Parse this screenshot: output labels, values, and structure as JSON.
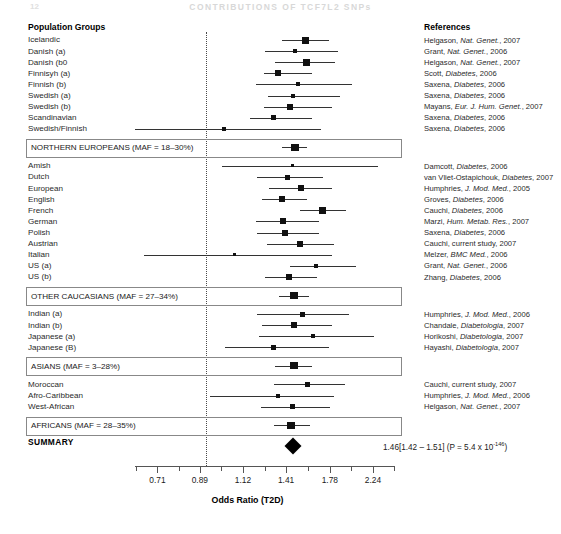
{
  "running_head": "CONTRIBUTIONS OF TCF7L2 SNPs",
  "page_number": "12",
  "headers": {
    "population_groups": "Population Groups",
    "references": "References"
  },
  "axis": {
    "title": "Odds Ratio (T2D)",
    "tick_labels": [
      "0.71",
      "0.89",
      "1.12",
      "1.41",
      "1.78",
      "2.24"
    ],
    "tick_values": [
      0.71,
      0.89,
      1.12,
      1.41,
      1.78,
      2.24
    ],
    "null_value": "1.0",
    "scale": "log",
    "xmin": 0.63,
    "xmax": 2.52
  },
  "summary": {
    "label": "SUMMARY",
    "or": 1.46,
    "ci_low": 1.42,
    "ci_high": 1.51,
    "text": "1.46[1.42 – 1.51] (P = 5.4 x 10",
    "exponent": "-146",
    "text_tail": ")"
  },
  "chart_data": {
    "type": "forest",
    "xlabel": "Odds Ratio (T2D)",
    "ylabel": "Population Groups",
    "xscale": "log",
    "xlim": [
      0.63,
      2.52
    ],
    "null_line": 1.0,
    "groups": [
      {
        "name": "NORTHERN EUROPEANS",
        "maf": "18–30%",
        "summary_label": "NORTHERN EUROPEANS (MAF = 18–30%)",
        "summary_or": 1.48,
        "summary_ci": [
          1.38,
          1.58
        ],
        "studies": [
          {
            "label": "Icelandic",
            "or": 1.56,
            "ci": [
              1.38,
              1.77
            ],
            "weight": 5,
            "reference": "Helgason, ",
            "ref_italic": "Nat. Genet.",
            "ref_tail": ", 2007"
          },
          {
            "label": "Danish (a)",
            "or": 1.48,
            "ci": [
              1.26,
              1.86
            ],
            "weight": 2,
            "reference": "Grant, ",
            "ref_italic": "Nat. Genet.",
            "ref_tail": ", 2006"
          },
          {
            "label": "Danish (b0",
            "or": 1.57,
            "ci": [
              1.33,
              1.83
            ],
            "weight": 5,
            "reference": "Helgason, ",
            "ref_italic": "Nat. Genet.",
            "ref_tail": ", 2007"
          },
          {
            "label": "Finnisyh (a)",
            "or": 1.35,
            "ci": [
              1.25,
              1.62
            ],
            "weight": 4,
            "reference": "Scott, ",
            "ref_italic": "Diabetes",
            "ref_tail": ", 2006"
          },
          {
            "label": "Finnish (b)",
            "or": 1.5,
            "ci": [
              1.2,
              2.0
            ],
            "weight": 2,
            "reference": "Saxena, ",
            "ref_italic": "Diabetes",
            "ref_tail": ", 2006"
          },
          {
            "label": "Swedish (a)",
            "or": 1.46,
            "ci": [
              1.28,
              1.88
            ],
            "weight": 2,
            "reference": "Saxena, ",
            "ref_italic": "Diabetes",
            "ref_tail": ", 2006"
          },
          {
            "label": "Swedish (b)",
            "or": 1.44,
            "ci": [
              1.25,
              1.8
            ],
            "weight": 4,
            "reference": "Mayans, ",
            "ref_italic": "Eur. J. Hum. Genet.",
            "ref_tail": ", 2007"
          },
          {
            "label": "Scandinavian",
            "or": 1.32,
            "ci": [
              1.16,
              1.62
            ],
            "weight": 3,
            "reference": "Saxena, ",
            "ref_italic": "Diabetes",
            "ref_tail": ", 2006"
          },
          {
            "label": "Swedish/Finnish",
            "or": 1.01,
            "ci": [
              0.63,
              1.7
            ],
            "weight": 2,
            "reference": "Saxena, ",
            "ref_italic": "Diabetes",
            "ref_tail": ", 2006"
          }
        ]
      },
      {
        "name": "OTHER CAUCASIANS",
        "maf": "27–34%",
        "summary_label": "OTHER CAUCASIANS (MAF = 27–34%)",
        "summary_or": 1.47,
        "summary_ci": [
          1.36,
          1.59
        ],
        "studies": [
          {
            "label": "Amish",
            "or": 1.46,
            "ci": [
              1.0,
              2.3
            ],
            "weight": 1,
            "reference": "Damcott, ",
            "ref_italic": "Diabetes",
            "ref_tail": ", 2006"
          },
          {
            "label": "Dutch",
            "or": 1.42,
            "ci": [
              1.21,
              1.72
            ],
            "weight": 3,
            "reference": "van Vliet-Ostapichouk, ",
            "ref_italic": "Diabetes",
            "ref_tail": ", 2007"
          },
          {
            "label": "European",
            "or": 1.53,
            "ci": [
              1.29,
              1.8
            ],
            "weight": 4,
            "reference": "Humphries, ",
            "ref_italic": "J. Mod. Med.",
            "ref_tail": ", 2005"
          },
          {
            "label": "English",
            "or": 1.38,
            "ci": [
              1.24,
              1.58
            ],
            "weight": 4,
            "reference": "Groves, ",
            "ref_italic": "Diabetes",
            "ref_tail": ", 2006"
          },
          {
            "label": "French",
            "or": 1.71,
            "ci": [
              1.52,
              1.94
            ],
            "weight": 5,
            "reference": "Cauchi, ",
            "ref_italic": "Diabetes",
            "ref_tail": ", 2006"
          },
          {
            "label": "German",
            "or": 1.39,
            "ci": [
              1.2,
              1.68
            ],
            "weight": 4,
            "reference": "Marzi, ",
            "ref_italic": "Hum. Metab. Res.",
            "ref_tail": ", 2007"
          },
          {
            "label": "Polish",
            "or": 1.4,
            "ci": [
              1.21,
              1.68
            ],
            "weight": 4,
            "reference": "Saxena, ",
            "ref_italic": "Diabetes",
            "ref_tail": ", 2006"
          },
          {
            "label": "Austrian",
            "or": 1.52,
            "ci": [
              1.27,
              1.82
            ],
            "weight": 4,
            "reference": "Cauchi, current study, 2007",
            "ref_italic": "",
            "ref_tail": ""
          },
          {
            "label": "Italian",
            "or": 1.07,
            "ci": [
              0.66,
              1.8
            ],
            "weight": 1,
            "reference": "Melzer, ",
            "ref_italic": "BMC Med.",
            "ref_tail": ", 2006"
          },
          {
            "label": "US (a)",
            "or": 1.65,
            "ci": [
              1.44,
              2.05
            ],
            "weight": 2,
            "reference": "Grant, ",
            "ref_italic": "Nat. Genet.",
            "ref_tail": ", 2006"
          },
          {
            "label": "US (b)",
            "or": 1.43,
            "ci": [
              1.26,
              1.66
            ],
            "weight": 4,
            "reference": "Zhang, ",
            "ref_italic": "Diabetes",
            "ref_tail": ", 2006"
          }
        ]
      },
      {
        "name": "ASIANS",
        "maf": "3–28%",
        "summary_label": "ASIANS (MAF = 3–28%)",
        "summary_or": 1.47,
        "summary_ci": [
          1.33,
          1.62
        ],
        "studies": [
          {
            "label": "Indian (a)",
            "or": 1.54,
            "ci": [
              1.21,
              1.97
            ],
            "weight": 3,
            "reference": "Humphries, ",
            "ref_italic": "J. Mod. Med.",
            "ref_tail": ", 2006"
          },
          {
            "label": "Indian (b)",
            "or": 1.47,
            "ci": [
              1.24,
              1.8
            ],
            "weight": 4,
            "reference": "Chandale, ",
            "ref_italic": "Diabetologia",
            "ref_tail": ", 2007"
          },
          {
            "label": "Japanese (a)",
            "or": 1.63,
            "ci": [
              1.22,
              2.25
            ],
            "weight": 2,
            "reference": "Horikoshi, ",
            "ref_italic": "Diabetologia",
            "ref_tail": ", 2007"
          },
          {
            "label": "Japanese (B)",
            "or": 1.32,
            "ci": [
              1.02,
              1.77
            ],
            "weight": 3,
            "reference": "Hayashi, ",
            "ref_italic": "Diabetologia",
            "ref_tail": ", 2007"
          }
        ]
      },
      {
        "name": "AFRICANS",
        "maf": "28–35%",
        "summary_label": "AFRICANS (MAF = 28–35%)",
        "summary_or": 1.45,
        "summary_ci": [
          1.32,
          1.6
        ],
        "studies": [
          {
            "label": "Moroccan",
            "or": 1.58,
            "ci": [
              1.32,
              1.93
            ],
            "weight": 3,
            "reference": "Cauchi, current study, 2007",
            "ref_italic": "",
            "ref_tail": ""
          },
          {
            "label": "Afro-Caribbean",
            "or": 1.35,
            "ci": [
              0.94,
              1.82
            ],
            "weight": 2,
            "reference": "Humphries, ",
            "ref_italic": "J. Mod. Med.",
            "ref_tail": ", 2006"
          },
          {
            "label": "West-African",
            "or": 1.46,
            "ci": [
              1.23,
              1.78
            ],
            "weight": 3,
            "reference": "Helgason, ",
            "ref_italic": "Nat. Genet.",
            "ref_tail": ", 2007"
          }
        ]
      }
    ]
  }
}
